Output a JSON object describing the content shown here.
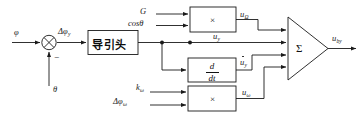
{
  "diagram": {
    "stroke_color": "#1a1a1a",
    "background": "#ffffff",
    "signals": {
      "phi": "φ",
      "delta_phi_y": "Δφ",
      "delta_phi_y_sub": "y",
      "theta": "θ",
      "minus": "−",
      "gain_G": "G",
      "cos_theta": "cosθ",
      "u_omega_cap": "u",
      "u_omega_cap_sub": "Ω",
      "u_y": "u",
      "u_y_sub": "y",
      "u_dot_y": "u",
      "u_dot_y_sub": "y",
      "k_omega": "k",
      "k_omega_sub": "ω",
      "delta_phi_omega": "Δφ",
      "delta_phi_omega_sub": "ω",
      "u_omega": "u",
      "u_omega_sub": "ω",
      "u_out": "u",
      "u_out_sub": "by"
    },
    "blocks": {
      "seeker_label": "导引头",
      "multiplier_top": "×",
      "multiplier_bottom": "×",
      "derivative_num": "d",
      "derivative_den": "dt",
      "summer": "Σ"
    }
  }
}
